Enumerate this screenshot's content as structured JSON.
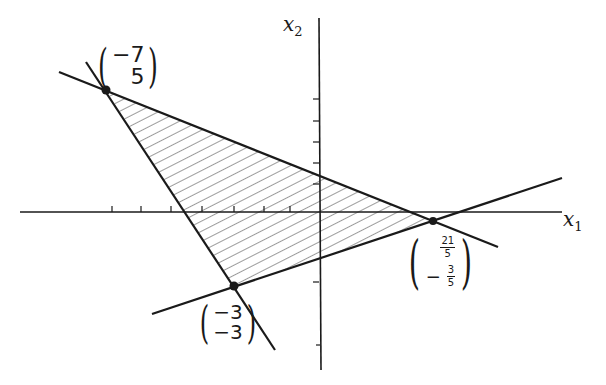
{
  "figure": {
    "title": "",
    "colors": {
      "ink": "#1a1a1a",
      "hatch": "#3a3a3a",
      "background": "#ffffff"
    }
  },
  "axes": {
    "x_label_var": "x",
    "x_label_sub": "1",
    "y_label_var": "x",
    "y_label_sub": "2",
    "x_ticks": [
      -7,
      -6,
      -5,
      -4,
      -3,
      -2,
      -1,
      1,
      2,
      3,
      4,
      5,
      6
    ],
    "y_ticks": [
      -3,
      -2,
      -1,
      1,
      2,
      3,
      4,
      5
    ]
  },
  "region": {
    "type": "hatched-triangle",
    "vertices": [
      {
        "x": -7,
        "y": 5
      },
      {
        "x": -3,
        "y": -3
      },
      {
        "x": 4.2,
        "y": -0.6
      }
    ]
  },
  "vertex_labels": {
    "v1": {
      "top": "−7",
      "bottom": "5"
    },
    "v2": {
      "top": "−3",
      "bottom": "−3"
    },
    "v3": {
      "top_num": "21",
      "top_den": "5",
      "bottom_sign": "−",
      "bottom_num": "3",
      "bottom_den": "5"
    }
  },
  "lines": [
    {
      "name": "line-through-v1-v3",
      "from": "(-7,5)",
      "to": "(21/5,-3/5)"
    },
    {
      "name": "line-through-v1-v2",
      "from": "(-7,5)",
      "to": "(-3,-3)"
    },
    {
      "name": "line-through-v2-v3",
      "from": "(-3,-3)",
      "to": "(21/5,-3/5)"
    }
  ]
}
